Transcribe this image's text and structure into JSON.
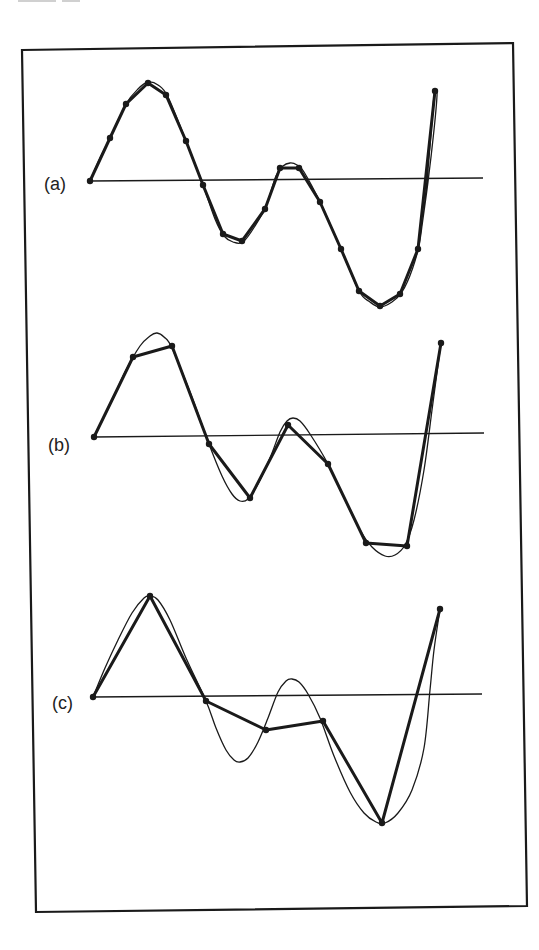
{
  "figure": {
    "background": "#ffffff",
    "ink": "#1a1a1a",
    "frame": {
      "points": [
        [
          22,
          50
        ],
        [
          513,
          43
        ],
        [
          527,
          906
        ],
        [
          36,
          912
        ]
      ],
      "stroke_width": 2.2
    }
  },
  "chart_data": {
    "type": "line",
    "title": "",
    "grid": false,
    "legend": null,
    "panels": [
      {
        "label": "(a)",
        "label_pos": [
          44,
          191
        ],
        "axis": {
          "x1": 90,
          "y1": 181,
          "x2": 483,
          "y2": 178
        },
        "curve": [
          [
            90,
            181
          ],
          [
            100,
            158
          ],
          [
            112,
            134
          ],
          [
            126,
            104
          ],
          [
            138,
            89
          ],
          [
            148,
            82
          ],
          [
            158,
            85
          ],
          [
            168,
            97
          ],
          [
            186,
            141
          ],
          [
            203,
            185
          ],
          [
            215,
            219
          ],
          [
            224,
            236
          ],
          [
            233,
            242
          ],
          [
            243,
            242
          ],
          [
            255,
            226
          ],
          [
            266,
            206
          ],
          [
            276,
            176
          ],
          [
            283,
            166
          ],
          [
            290,
            163
          ],
          [
            297,
            165
          ],
          [
            304,
            172
          ],
          [
            320,
            202
          ],
          [
            341,
            249
          ],
          [
            359,
            291
          ],
          [
            370,
            302
          ],
          [
            380,
            307
          ],
          [
            392,
            302
          ],
          [
            402,
            292
          ],
          [
            412,
            270
          ],
          [
            420,
            240
          ],
          [
            427,
            180
          ],
          [
            432,
            120
          ],
          [
            434,
            96
          ],
          [
            436,
            92
          ],
          [
            437,
            96
          ],
          [
            434,
            130
          ],
          [
            428,
            182
          ],
          [
            420,
            240
          ]
        ],
        "samples": [
          [
            90,
            181
          ],
          [
            110,
            138
          ],
          [
            126,
            104
          ],
          [
            148,
            83
          ],
          [
            166,
            95
          ],
          [
            186,
            141
          ],
          [
            203,
            185
          ],
          [
            223,
            234
          ],
          [
            242,
            241
          ],
          [
            265,
            209
          ],
          [
            280,
            168
          ],
          [
            299,
            168
          ],
          [
            320,
            202
          ],
          [
            341,
            249
          ],
          [
            359,
            291
          ],
          [
            380,
            306
          ],
          [
            400,
            294
          ],
          [
            418,
            249
          ],
          [
            435,
            91
          ]
        ],
        "sample_count": 19
      },
      {
        "label": "(b)",
        "label_pos": [
          48,
          452
        ],
        "axis": {
          "x1": 94,
          "y1": 437,
          "x2": 484,
          "y2": 433
        },
        "curve": [
          [
            94,
            437
          ],
          [
            110,
            405
          ],
          [
            125,
            372
          ],
          [
            140,
            346
          ],
          [
            150,
            336
          ],
          [
            157,
            333
          ],
          [
            164,
            337
          ],
          [
            172,
            348
          ],
          [
            190,
            392
          ],
          [
            209,
            444
          ],
          [
            222,
            476
          ],
          [
            232,
            494
          ],
          [
            240,
            501
          ],
          [
            248,
            499
          ],
          [
            258,
            484
          ],
          [
            270,
            458
          ],
          [
            280,
            432
          ],
          [
            287,
            421
          ],
          [
            293,
            418
          ],
          [
            300,
            421
          ],
          [
            310,
            434
          ],
          [
            328,
            464
          ],
          [
            346,
            502
          ],
          [
            360,
            530
          ],
          [
            372,
            547
          ],
          [
            385,
            556
          ],
          [
            395,
            555
          ],
          [
            405,
            545
          ],
          [
            414,
            520
          ],
          [
            424,
            470
          ],
          [
            432,
            410
          ],
          [
            438,
            365
          ],
          [
            441,
            343
          ]
        ],
        "samples": [
          [
            94,
            437
          ],
          [
            133,
            357
          ],
          [
            172,
            346
          ],
          [
            209,
            444
          ],
          [
            250,
            498
          ],
          [
            288,
            425
          ],
          [
            328,
            464
          ],
          [
            366,
            543
          ],
          [
            407,
            546
          ],
          [
            441,
            343
          ]
        ],
        "sample_count": 10
      },
      {
        "label": "(c)",
        "label_pos": [
          52,
          710
        ],
        "axis": {
          "x1": 93,
          "y1": 697,
          "x2": 482,
          "y2": 694
        },
        "curve": [
          [
            93,
            697
          ],
          [
            105,
            668
          ],
          [
            118,
            640
          ],
          [
            132,
            613
          ],
          [
            144,
            598
          ],
          [
            150,
            596
          ],
          [
            158,
            600
          ],
          [
            170,
            620
          ],
          [
            186,
            658
          ],
          [
            206,
            701
          ],
          [
            216,
            728
          ],
          [
            226,
            750
          ],
          [
            234,
            760
          ],
          [
            240,
            762
          ],
          [
            248,
            758
          ],
          [
            258,
            742
          ],
          [
            268,
            718
          ],
          [
            278,
            692
          ],
          [
            286,
            681
          ],
          [
            292,
            679
          ],
          [
            299,
            682
          ],
          [
            308,
            694
          ],
          [
            320,
            718
          ],
          [
            334,
            756
          ],
          [
            350,
            792
          ],
          [
            364,
            813
          ],
          [
            376,
            822
          ],
          [
            385,
            823
          ],
          [
            398,
            813
          ],
          [
            412,
            790
          ],
          [
            424,
            748
          ],
          [
            430,
            690
          ],
          [
            434,
            650
          ],
          [
            440,
            609
          ]
        ],
        "samples": [
          [
            93,
            697
          ],
          [
            150,
            596
          ],
          [
            206,
            701
          ],
          [
            266,
            730
          ],
          [
            323,
            721
          ],
          [
            382,
            823
          ],
          [
            440,
            609
          ]
        ],
        "sample_count": 7
      }
    ]
  }
}
